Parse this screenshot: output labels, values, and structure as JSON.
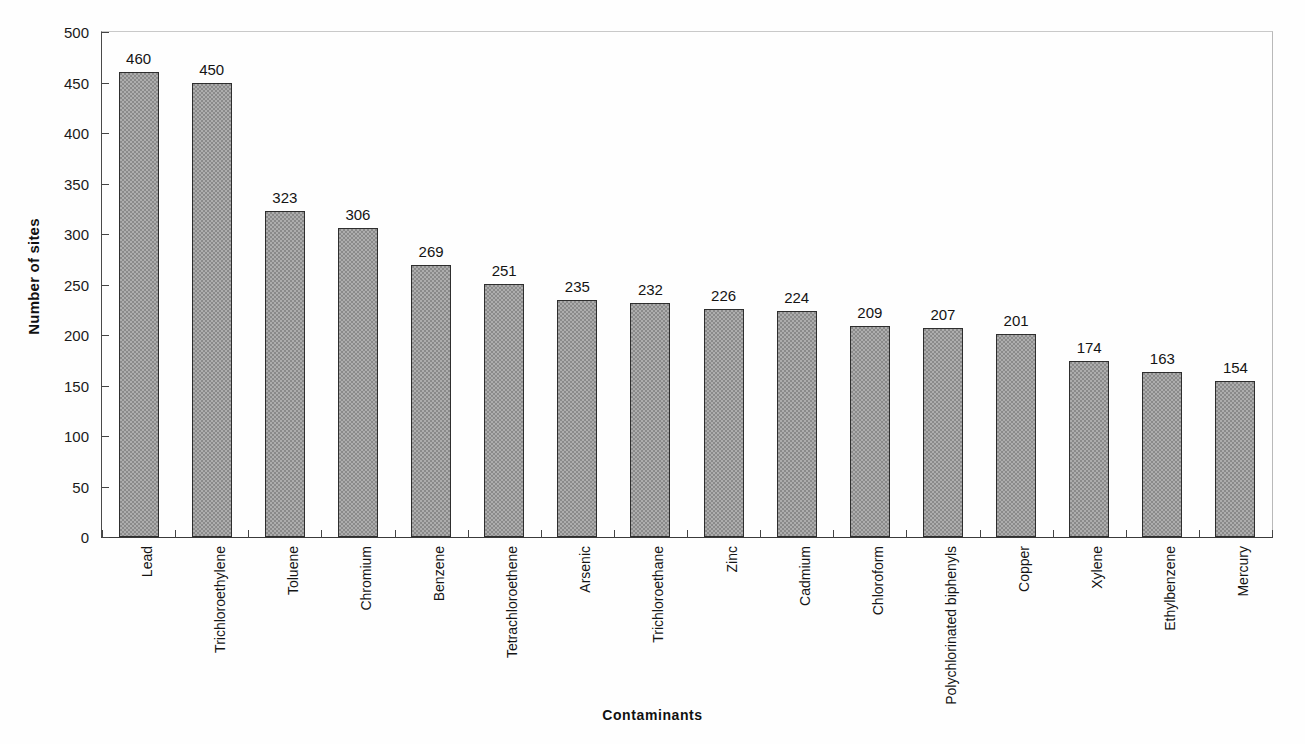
{
  "chart_data": {
    "type": "bar",
    "title": "",
    "xlabel": "Contaminants",
    "ylabel": "Number of sites",
    "ylim": [
      0,
      500
    ],
    "ytick_step": 50,
    "yticks": [
      0,
      50,
      100,
      150,
      200,
      250,
      300,
      350,
      400,
      450,
      500
    ],
    "grid": false,
    "legend": null,
    "bar_color": "#8a8a8a",
    "bar_edge_color": "#2e2e2e",
    "categories": [
      "Lead",
      "Trichloroethylene",
      "Toluene",
      "Chromium",
      "Benzene",
      "Tetrachloroethene",
      "Arsenic",
      "Trichloroethane",
      "Zinc",
      "Cadmium",
      "Chloroform",
      "Polychlorinated biphenyls",
      "Copper",
      "Xylene",
      "Ethylbenzene",
      "Mercury"
    ],
    "values": [
      460,
      450,
      323,
      306,
      269,
      251,
      235,
      232,
      226,
      224,
      209,
      207,
      201,
      174,
      163,
      154
    ],
    "value_labels": [
      "460",
      "450",
      "323",
      "306",
      "269",
      "251",
      "235",
      "232",
      "226",
      "224",
      "209",
      "207",
      "201",
      "174",
      "163",
      "154"
    ],
    "ytick_labels": [
      "0",
      "50",
      "100",
      "150",
      "200",
      "250",
      "300",
      "350",
      "400",
      "450",
      "500"
    ]
  }
}
